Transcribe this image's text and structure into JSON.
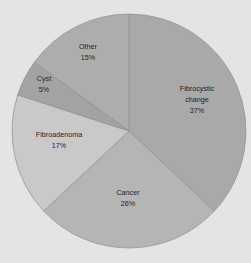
{
  "chart_data": {
    "type": "pie",
    "title": "",
    "start_angle_deg": 0,
    "direction": "clockwise",
    "slices": [
      {
        "label": "Fibrocystic change",
        "lines": [
          "Fibrocystic",
          "change",
          "37%"
        ],
        "value": 37,
        "color": "#a9a9a9"
      },
      {
        "label": "Cancer",
        "lines": [
          "Cancer",
          "26%"
        ],
        "value": 26,
        "color": "#b5b5b5"
      },
      {
        "label": "Fibroadenoma",
        "lines": [
          "Fibroadenoma",
          "17%"
        ],
        "value": 17,
        "color": "#c9c9c9"
      },
      {
        "label": "Cyst",
        "lines": [
          "Cyst",
          "5%"
        ],
        "value": 5,
        "color": "#a3a3a3"
      },
      {
        "label": "Other",
        "lines": [
          "Other",
          "15%"
        ],
        "value": 15,
        "color": "#adadad"
      }
    ],
    "categories": [
      "Fibrocystic change",
      "Cancer",
      "Fibroadenoma",
      "Cyst",
      "Other"
    ],
    "values": [
      37,
      26,
      17,
      5,
      15
    ],
    "legend": "none (labels inside slices)"
  },
  "layout": {
    "cx": 129,
    "cy": 131,
    "r": 117,
    "background": "#e4e4e4",
    "edge_color": "#8f8f8f",
    "label_positions": [
      {
        "x": 197,
        "y": 99
      },
      {
        "x": 128,
        "y": 197
      },
      {
        "x": 59,
        "y": 139
      },
      {
        "x": 44,
        "y": 83
      },
      {
        "x": 88,
        "y": 51
      }
    ]
  }
}
